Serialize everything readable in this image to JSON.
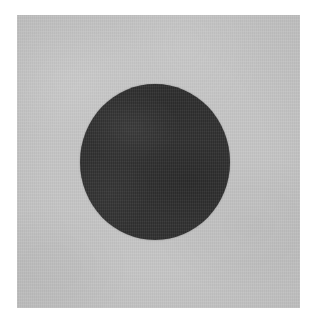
{
  "image": {
    "kind": "photograph",
    "subject": "dark circular disc on light gray background",
    "canvas": {
      "width_px": 317,
      "height_px": 326,
      "background_color": "#ffffff"
    },
    "panel": {
      "label": "gray background field",
      "left_px": 17,
      "top_px": 15,
      "width_px": 283,
      "height_px": 293,
      "fill_color": "#c6c6c6",
      "texture": "fine photographic grain"
    },
    "shapes": [
      {
        "name": "dark-circle",
        "type": "circle",
        "center_x_px": 155,
        "center_y_px": 159,
        "radius_px": 75,
        "diameter_px": 149,
        "fill_color": "#343434",
        "edge": "soft anti-aliased",
        "texture": "fine photographic grain"
      }
    ],
    "palette": {
      "white_border": "#ffffff",
      "background_gray": "#c6c6c6",
      "circle_dark_gray": "#343434"
    },
    "text_content": []
  }
}
